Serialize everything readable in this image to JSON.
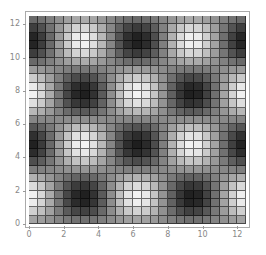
{
  "chart_data": {
    "type": "heatmap",
    "title": "",
    "xlabel": "",
    "ylabel": "",
    "function": "sin(y)*cos(x)",
    "colormap": "grayscale (dark = low, light = high)",
    "grid": true,
    "cell_size": 0.5,
    "xlim": [
      0,
      12.5
    ],
    "ylim": [
      0,
      12.5
    ],
    "x_ticks": [
      "0",
      "2",
      "4",
      "6",
      "8",
      "10",
      "12"
    ],
    "y_ticks": [
      "0",
      "2",
      "4",
      "6",
      "8",
      "10",
      "12"
    ],
    "extrema": {
      "minima": [
        [
          0,
          4.7
        ],
        [
          0,
          11.0
        ],
        [
          3.14,
          1.57
        ],
        [
          3.14,
          7.85
        ],
        [
          6.28,
          4.7
        ],
        [
          6.28,
          11.0
        ],
        [
          9.42,
          1.57
        ],
        [
          9.42,
          7.85
        ],
        [
          12.56,
          4.7
        ],
        [
          12.56,
          11.0
        ]
      ],
      "maxima": [
        [
          0,
          1.57
        ],
        [
          0,
          7.85
        ],
        [
          3.14,
          4.7
        ],
        [
          3.14,
          11.0
        ],
        [
          6.28,
          1.57
        ],
        [
          6.28,
          7.85
        ],
        [
          9.42,
          4.7
        ],
        [
          9.42,
          11.0
        ],
        [
          12.56,
          1.57
        ],
        [
          12.56,
          7.85
        ]
      ]
    }
  }
}
